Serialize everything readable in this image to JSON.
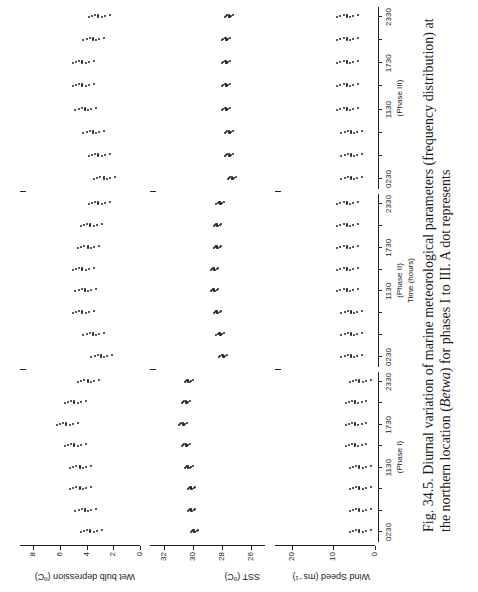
{
  "chart_data": {
    "type": "scatter",
    "title": "Diurnal variation of marine meteorological parameters",
    "xlabel": "Time (hours)",
    "phases": [
      {
        "name": "(Phase I)",
        "x_ticks": [
          "0230",
          "1130",
          "1730",
          "2330"
        ]
      },
      {
        "name": "(Phase II)",
        "x_ticks": [
          "0230",
          "1130",
          "1730",
          "2330"
        ]
      },
      {
        "name": "(Phase III)",
        "x_ticks": [
          "0230",
          "1130",
          "1730",
          "2330"
        ]
      }
    ],
    "panels": [
      {
        "ylabel": "Wet bulb depression (ºC)",
        "y_ticks": [
          "0",
          "2",
          "4",
          "6",
          "8"
        ],
        "ylim": [
          0,
          9
        ]
      },
      {
        "ylabel": "SST (ºC)",
        "y_ticks": [
          "26",
          "28",
          "30",
          "32"
        ],
        "ylim": [
          25,
          33
        ]
      },
      {
        "ylabel": "Wind Speed (ms⁻¹)",
        "y_ticks": [
          "0",
          "10",
          "20"
        ],
        "ylim": [
          0,
          24
        ]
      }
    ],
    "series": [
      {
        "name": "Wet bulb depression",
        "phase": "I",
        "times": [
          "0230",
          "0530",
          "0830",
          "1130",
          "1430",
          "1730",
          "2030",
          "2330"
        ],
        "values": [
          3.8,
          4.2,
          4.6,
          4.6,
          5.0,
          5.6,
          5.0,
          4.0
        ]
      },
      {
        "name": "Wet bulb depression",
        "phase": "II",
        "times": [
          "0230",
          "0530",
          "0830",
          "1130",
          "1430",
          "1730",
          "2030",
          "2330"
        ],
        "values": [
          3.0,
          3.6,
          4.4,
          4.2,
          4.4,
          4.0,
          3.8,
          3.2
        ]
      },
      {
        "name": "Wet bulb depression",
        "phase": "III",
        "times": [
          "0230",
          "0530",
          "0830",
          "1130",
          "1430",
          "1730",
          "2030",
          "2330"
        ],
        "values": [
          2.8,
          3.2,
          3.6,
          4.2,
          4.4,
          4.4,
          3.6,
          3.2
        ]
      },
      {
        "name": "SST",
        "phase": "I",
        "times": [
          "0230",
          "0530",
          "0830",
          "1130",
          "1430",
          "1730",
          "2030",
          "2330"
        ],
        "values": [
          30.0,
          30.2,
          30.2,
          30.4,
          30.6,
          30.8,
          30.6,
          30.4
        ]
      },
      {
        "name": "SST",
        "phase": "II",
        "times": [
          "0230",
          "0530",
          "0830",
          "1130",
          "1430",
          "1730",
          "2030",
          "2330"
        ],
        "values": [
          28.0,
          28.2,
          28.4,
          28.6,
          28.6,
          28.4,
          28.4,
          28.2
        ]
      },
      {
        "name": "SST",
        "phase": "III",
        "times": [
          "0230",
          "0530",
          "0830",
          "1130",
          "1430",
          "1730",
          "2030",
          "2330"
        ],
        "values": [
          27.4,
          27.6,
          27.6,
          27.8,
          27.8,
          27.8,
          27.8,
          27.6
        ]
      },
      {
        "name": "Wind Speed",
        "phase": "I",
        "times": [
          "0230",
          "0530",
          "0830",
          "1130",
          "1430",
          "1730",
          "2030",
          "2330"
        ],
        "values": [
          4,
          4,
          4,
          4,
          5,
          5,
          5,
          4
        ]
      },
      {
        "name": "Wind Speed",
        "phase": "II",
        "times": [
          "0230",
          "0530",
          "0830",
          "1130",
          "1430",
          "1730",
          "2030",
          "2330"
        ],
        "values": [
          6,
          6,
          6,
          7,
          7,
          7,
          7,
          7
        ]
      },
      {
        "name": "Wind Speed",
        "phase": "III",
        "times": [
          "0230",
          "0530",
          "0830",
          "1130",
          "1430",
          "1730",
          "2030",
          "2330"
        ],
        "values": [
          6,
          6,
          6,
          7,
          7,
          7,
          7,
          7
        ]
      }
    ],
    "grid": false,
    "orientation": "rotated 90° counter-clockwise"
  },
  "caption": {
    "prefix": "Fig. 34.5. Diurnal variation of marine meteorological parameters (frequency distribution) at the northern location (",
    "italic": "Betwa",
    "suffix": ") for phases I to III. A dot represents"
  }
}
